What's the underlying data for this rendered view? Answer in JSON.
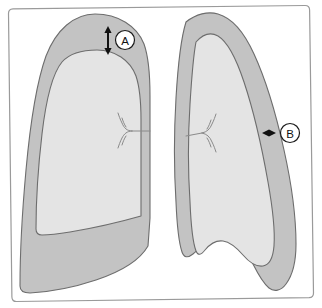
{
  "figure": {
    "canvas": {
      "width": 322,
      "height": 308
    },
    "frame": {
      "name": "figure-border",
      "stroke_color": "#9a9a9a",
      "fill_color": "#ffffff",
      "corner_radius": 6
    },
    "colors": {
      "pleural_space_fill": "#c3c3c3",
      "lung_fill": "#e4e4e4",
      "outline_stroke": "#6d6d6d",
      "bronchus_stroke": "#8a8a8a",
      "arrow_color": "#111111",
      "marker_fill": "#ffffff",
      "marker_stroke": "#1a1a1a",
      "background": "#ffffff"
    },
    "regions": [
      {
        "name": "left-hemithorax-pleural-space",
        "label": "Pleural space (air)",
        "fill": "#c3c3c3"
      },
      {
        "name": "left-lung",
        "label": "Collapsed left lung",
        "fill": "#e4e4e4"
      },
      {
        "name": "right-hemithorax-pleural-space",
        "label": "Pleural space (air)",
        "fill": "#c3c3c3"
      },
      {
        "name": "right-lung",
        "label": "Collapsed right lung",
        "fill": "#e4e4e4"
      }
    ],
    "markers": [
      {
        "id": "A",
        "label": "A",
        "name": "measurement-marker-a",
        "orientation": "vertical",
        "meaning": "Apical interpleural distance",
        "circle": {
          "cx": 125,
          "cy": 40,
          "r": 9.5
        },
        "arrow": {
          "x1": 108,
          "y1": 26,
          "x2": 108,
          "y2": 55
        }
      },
      {
        "id": "B",
        "label": "B",
        "name": "measurement-marker-b",
        "orientation": "horizontal",
        "meaning": "Lateral interpleural distance",
        "circle": {
          "cx": 290,
          "cy": 133,
          "r": 9.5
        },
        "arrow": {
          "x1": 262,
          "y1": 133,
          "x2": 276,
          "y2": 133
        }
      }
    ],
    "bronchi": [
      {
        "name": "left-bronchial-tree",
        "side": "left"
      },
      {
        "name": "right-bronchial-tree",
        "side": "right"
      }
    ]
  }
}
